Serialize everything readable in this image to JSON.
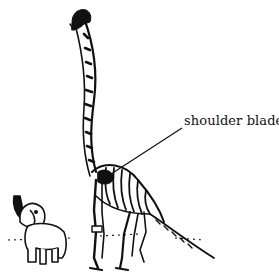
{
  "figure": {
    "subjects": [
      "brachiosaurus-skeleton",
      "elephant"
    ],
    "labels": [
      {
        "text": "shoulder blade",
        "target": "shoulder-blade"
      }
    ],
    "colors": {
      "ink": "#111111",
      "background": "#ffffff"
    }
  }
}
